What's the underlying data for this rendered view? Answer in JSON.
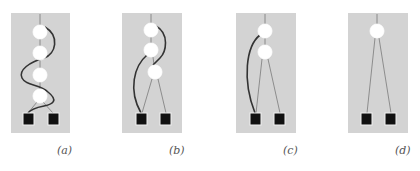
{
  "figure": {
    "panels": [
      {
        "id": "a",
        "label": "(a)",
        "nodes": 4,
        "leaves": 2
      },
      {
        "id": "b",
        "label": "(b)",
        "nodes": 3,
        "leaves": 2
      },
      {
        "id": "c",
        "label": "(c)",
        "nodes": 2,
        "leaves": 2
      },
      {
        "id": "d",
        "label": "(d)",
        "nodes": 1,
        "leaves": 2
      }
    ],
    "colors": {
      "panel_background": "#d3d3d3",
      "node_fill": "#ffffff",
      "leaf_fill": "#111111",
      "thin_edge": "#7a7a7a",
      "thick_edge": "#333333"
    }
  }
}
